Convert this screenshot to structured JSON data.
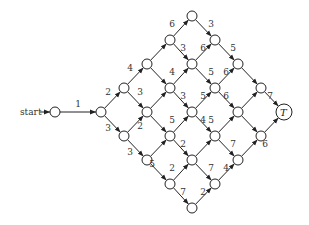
{
  "start_label": "start",
  "terminal_label": "T",
  "nodes": [
    {
      "id": "s",
      "x": 55,
      "y": 112
    },
    {
      "id": "a",
      "x": 101,
      "y": 112
    },
    {
      "id": "b1",
      "x": 124,
      "y": 88
    },
    {
      "id": "b2",
      "x": 124,
      "y": 136
    },
    {
      "id": "c1",
      "x": 147,
      "y": 64
    },
    {
      "id": "c2",
      "x": 147,
      "y": 112
    },
    {
      "id": "c3",
      "x": 147,
      "y": 160
    },
    {
      "id": "d1",
      "x": 170,
      "y": 40
    },
    {
      "id": "d2",
      "x": 170,
      "y": 88
    },
    {
      "id": "d3",
      "x": 170,
      "y": 136
    },
    {
      "id": "d4",
      "x": 170,
      "y": 184
    },
    {
      "id": "e1",
      "x": 192,
      "y": 16
    },
    {
      "id": "e2",
      "x": 192,
      "y": 64
    },
    {
      "id": "e3",
      "x": 192,
      "y": 112
    },
    {
      "id": "e4",
      "x": 192,
      "y": 160
    },
    {
      "id": "e5",
      "x": 192,
      "y": 208
    },
    {
      "id": "f1",
      "x": 215,
      "y": 40
    },
    {
      "id": "f2",
      "x": 215,
      "y": 88
    },
    {
      "id": "f3",
      "x": 215,
      "y": 136
    },
    {
      "id": "f4",
      "x": 215,
      "y": 184
    },
    {
      "id": "g1",
      "x": 238,
      "y": 64
    },
    {
      "id": "g2",
      "x": 238,
      "y": 112
    },
    {
      "id": "g3",
      "x": 238,
      "y": 160
    },
    {
      "id": "h1",
      "x": 261,
      "y": 88
    },
    {
      "id": "h2",
      "x": 261,
      "y": 136
    },
    {
      "id": "T",
      "x": 284,
      "y": 112
    }
  ],
  "edges": [
    {
      "from": "s",
      "to": "a",
      "w": "1"
    },
    {
      "from": "a",
      "to": "b1",
      "w": "2"
    },
    {
      "from": "a",
      "to": "b2",
      "w": "3"
    },
    {
      "from": "b1",
      "to": "c1",
      "w": "4"
    },
    {
      "from": "b1",
      "to": "c2",
      "w": "3"
    },
    {
      "from": "b2",
      "to": "c2",
      "w": "2"
    },
    {
      "from": "b2",
      "to": "c3",
      "w": "5"
    },
    {
      "from": "c1",
      "to": "d1",
      "w": "6"
    },
    {
      "from": "c1",
      "to": "d2",
      "w": "3"
    },
    {
      "from": "c2",
      "to": "d2",
      "w": "4"
    },
    {
      "from": "c2",
      "to": "d3",
      "w": "5"
    },
    {
      "from": "c3",
      "to": "d3",
      "w": "2"
    },
    {
      "from": "c3",
      "to": "d4",
      "w": "7"
    },
    {
      "from": "d1",
      "to": "e1",
      "w": ""
    },
    {
      "from": "e1",
      "to": "f1",
      "w": "3"
    },
    {
      "from": "d1",
      "to": "e2",
      "w": ""
    },
    {
      "from": "d2",
      "to": "e2",
      "w": ""
    },
    {
      "from": "d2",
      "to": "e3",
      "w": ""
    },
    {
      "from": "d3",
      "to": "e3",
      "w": ""
    },
    {
      "from": "d3",
      "to": "e4",
      "w": ""
    },
    {
      "from": "d4",
      "to": "e4",
      "w": ""
    },
    {
      "from": "d4",
      "to": "e5",
      "w": ""
    },
    {
      "from": "e2",
      "to": "f1",
      "w": "6"
    },
    {
      "from": "e2",
      "to": "f2",
      "w": "5"
    },
    {
      "from": "e3",
      "to": "f2",
      "w": "6"
    },
    {
      "from": "e3",
      "to": "f3",
      "w": "7"
    },
    {
      "from": "e4",
      "to": "f3",
      "w": "4"
    },
    {
      "from": "e4",
      "to": "f4",
      "w": "4"
    },
    {
      "from": "e5",
      "to": "f4",
      "w": "2"
    },
    {
      "from": "f1",
      "to": "g1",
      "w": "5"
    },
    {
      "from": "f2",
      "to": "g1",
      "w": "6"
    },
    {
      "from": "f2",
      "to": "g2",
      "w": "7"
    },
    {
      "from": "f3",
      "to": "g2",
      "w": "6"
    },
    {
      "from": "f3",
      "to": "g3",
      "w": "4"
    },
    {
      "from": "f4",
      "to": "g3",
      "w": "4"
    },
    {
      "from": "g1",
      "to": "h1",
      "w": "7"
    },
    {
      "from": "g2",
      "to": "h1",
      "w": "6"
    },
    {
      "from": "g2",
      "to": "h2",
      "w": "7"
    },
    {
      "from": "g3",
      "to": "h2",
      "w": "6"
    },
    {
      "from": "h1",
      "to": "T",
      "w": "7"
    },
    {
      "from": "h2",
      "to": "T",
      "w": "6"
    }
  ],
  "labels": [
    {
      "t": "1",
      "x": 78,
      "y": 107
    },
    {
      "t": "2",
      "x": 108,
      "y": 95
    },
    {
      "t": "3",
      "x": 108,
      "y": 131
    },
    {
      "t": "4",
      "x": 130,
      "y": 71
    },
    {
      "t": "3",
      "x": 140,
      "y": 95
    },
    {
      "t": "2",
      "x": 140,
      "y": 129
    },
    {
      "t": "3",
      "x": 130,
      "y": 155
    },
    {
      "t": "6",
      "x": 172,
      "y": 27
    },
    {
      "t": "3",
      "x": 183,
      "y": 51
    },
    {
      "t": "4",
      "x": 172,
      "y": 75
    },
    {
      "t": "3",
      "x": 183,
      "y": 99
    },
    {
      "t": "5",
      "x": 172,
      "y": 123
    },
    {
      "t": "2",
      "x": 183,
      "y": 147
    },
    {
      "t": "5",
      "x": 152,
      "y": 167
    },
    {
      "t": "2",
      "x": 172,
      "y": 171
    },
    {
      "t": "7",
      "x": 183,
      "y": 195
    },
    {
      "t": "3",
      "x": 211,
      "y": 27
    },
    {
      "t": "6",
      "x": 203,
      "y": 51
    },
    {
      "t": "5",
      "x": 211,
      "y": 75
    },
    {
      "t": "5",
      "x": 203,
      "y": 99
    },
    {
      "t": "6",
      "x": 226,
      "y": 99
    },
    {
      "t": "4",
      "x": 203,
      "y": 123
    },
    {
      "t": "5",
      "x": 211,
      "y": 123
    },
    {
      "t": "7",
      "x": 211,
      "y": 171
    },
    {
      "t": "4",
      "x": 226,
      "y": 171
    },
    {
      "t": "2",
      "x": 203,
      "y": 195
    },
    {
      "t": "5",
      "x": 233,
      "y": 51
    },
    {
      "t": "6",
      "x": 226,
      "y": 75
    },
    {
      "t": "7",
      "x": 233,
      "y": 147
    },
    {
      "t": "7",
      "x": 270,
      "y": 99
    },
    {
      "t": "6",
      "x": 265,
      "y": 147
    }
  ]
}
